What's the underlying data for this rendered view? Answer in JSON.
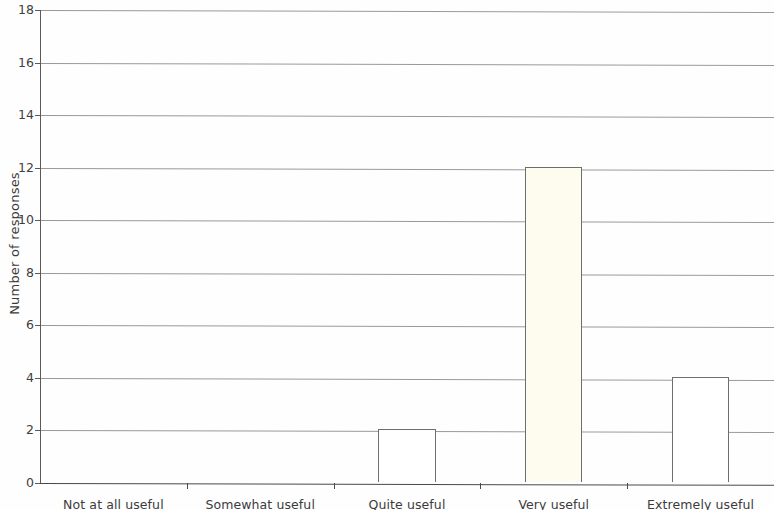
{
  "chart_data": {
    "type": "bar",
    "title": "",
    "xlabel": "",
    "ylabel": "Number of responses",
    "categories": [
      "Not at all useful",
      "Somewhat useful",
      "Quite useful",
      "Very useful",
      "Extremely useful"
    ],
    "values": [
      0,
      0,
      2,
      12,
      4
    ],
    "ylim": [
      0,
      18
    ],
    "ytick_labels": [
      "0",
      "2",
      "4",
      "6",
      "8",
      "10",
      "12",
      "14",
      "16",
      "18"
    ],
    "ytick_values": [
      0,
      2,
      4,
      6,
      8,
      10,
      12,
      14,
      16,
      18
    ],
    "grid": true,
    "legend": false,
    "bar_colors": [
      "#ffffff",
      "#ffffff",
      "#ffffff",
      "#fdfcee",
      "#ffffff"
    ],
    "bar_edge_color": "#6e6e6e",
    "gridline_color": "#9a9a9a",
    "axis_color": "#4a4a4a",
    "text_color": "#3b3b3b",
    "background_color": "#fefefe"
  }
}
